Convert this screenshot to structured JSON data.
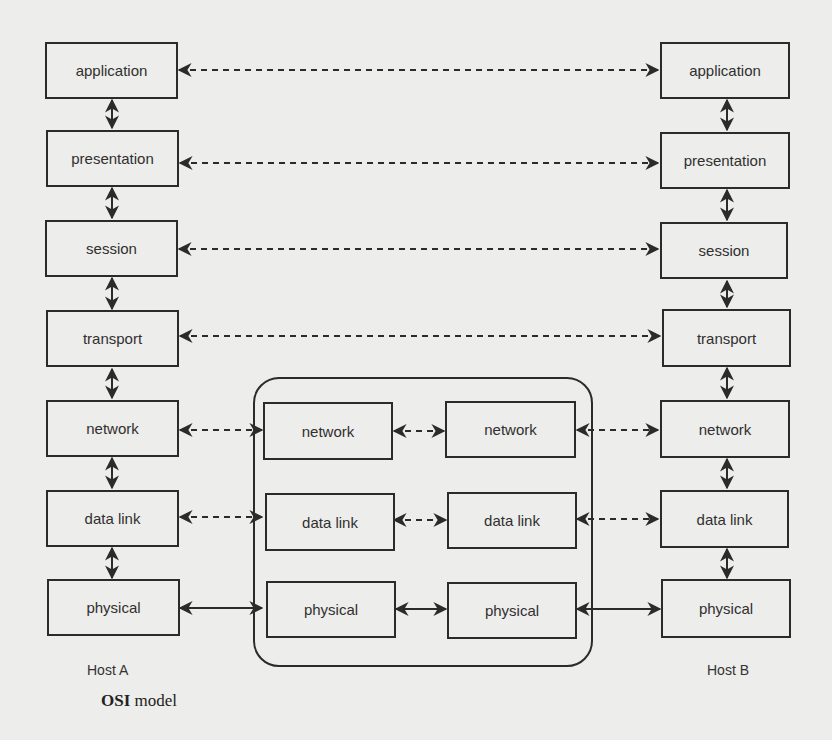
{
  "diagram": {
    "title_bold": "OSI",
    "title_rest": " model",
    "host_a": {
      "label": "Host A",
      "layers": [
        "application",
        "presentation",
        "session",
        "transport",
        "network",
        "data link",
        "physical"
      ]
    },
    "host_b": {
      "label": "Host B",
      "layers": [
        "application",
        "presentation",
        "session",
        "transport",
        "network",
        "data link",
        "physical"
      ]
    },
    "intermediate": {
      "left": [
        "network",
        "data link",
        "physical"
      ],
      "right": [
        "network",
        "data link",
        "physical"
      ]
    },
    "connections": {
      "peer_dashed": [
        "application",
        "presentation",
        "session",
        "transport",
        "network",
        "data link"
      ],
      "physical_solid": [
        "physical"
      ]
    },
    "colors": {
      "line": "#2b2b2b",
      "background": "#ededeb"
    }
  }
}
